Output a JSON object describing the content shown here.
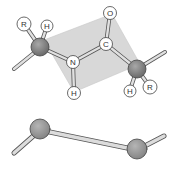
{
  "diagram": {
    "top_structure": {
      "plane_color": "#c8c8c8",
      "atoms": {
        "R_left": "R",
        "H_left": "H",
        "N": "N",
        "H_N": "H",
        "C": "C",
        "O": "O",
        "H_right": "H",
        "R_right": "R"
      },
      "alpha_carbon_color": "#8a8a8a"
    },
    "bottom_structure": {
      "description": "simplified backbone view",
      "alpha_carbon_color": "#9a9a9a"
    }
  }
}
